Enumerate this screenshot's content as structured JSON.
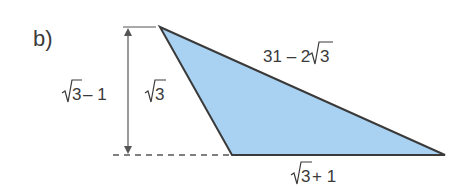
{
  "part_label": "b)",
  "colors": {
    "fill": "#a9d2f2",
    "stroke": "#3a3a3a",
    "dimension": "#555555"
  },
  "triangle": {
    "vertices": {
      "top": [
        160,
        27
      ],
      "bottom_left": [
        232,
        155
      ],
      "bottom_right": [
        445,
        155
      ]
    },
    "sides": {
      "left_side": {
        "radicand": "3",
        "prefix": "",
        "suffix": ""
      },
      "hypotenuse": {
        "prefix": "31 – 2",
        "radicand": "3",
        "suffix": ""
      },
      "base": {
        "prefix": "",
        "radicand": "3",
        "suffix": " + 1"
      }
    }
  },
  "height_dimension": {
    "prefix": "",
    "radicand": "3",
    "suffix": " – 1"
  }
}
